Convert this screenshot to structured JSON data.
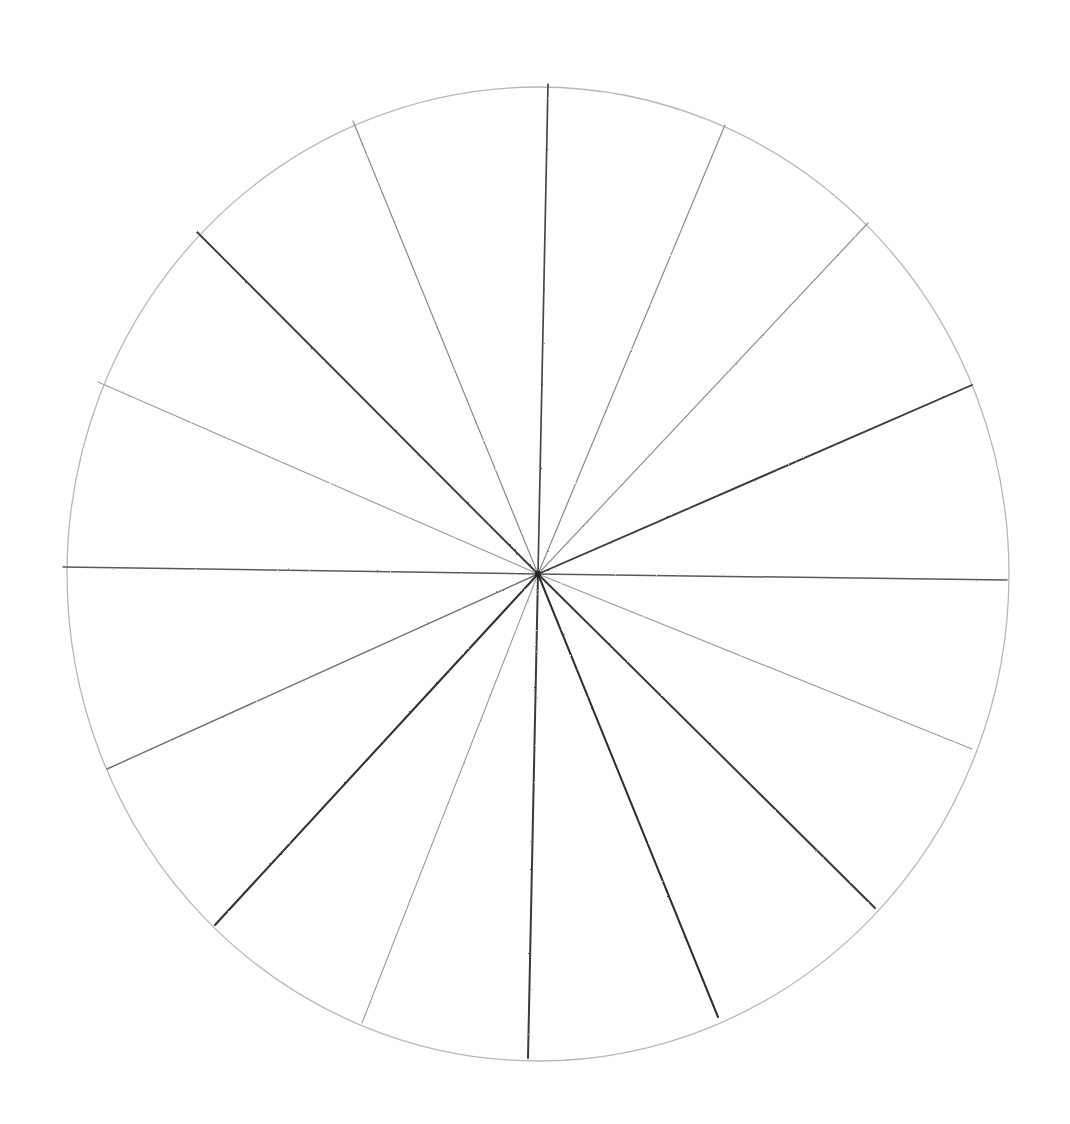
{
  "document": {
    "title": "Hand-drawn radial spoke circle",
    "medium": "pencil on white paper",
    "background_color": "#ffffff"
  },
  "chart_data": {
    "type": "pie",
    "title": "",
    "subtitle": "",
    "xlabel": "",
    "ylabel": "",
    "legend": [],
    "grid": false,
    "categories": [
      "S1",
      "S2",
      "S3",
      "S4",
      "S5",
      "S6",
      "S7",
      "S8",
      "S9",
      "S10",
      "S11",
      "S12",
      "S13",
      "S14",
      "S15",
      "S16"
    ],
    "values": [
      22.5,
      22.5,
      22.5,
      22.5,
      22.5,
      22.5,
      22.5,
      22.5,
      22.5,
      22.5,
      22.5,
      22.5,
      22.5,
      22.5,
      22.5,
      22.5
    ],
    "sector_count": 16,
    "sector_angle_degrees": 22.5,
    "circle": {
      "center_x": 538,
      "center_y": 574,
      "radius_x": 471,
      "radius_y": 487,
      "stroke_color": "#b8b8b8",
      "stroke_width": 1.3,
      "left_edge_x": 63,
      "right_edge_x": 1007,
      "top_edge_y": 84,
      "bottom_edge_y": 1058
    },
    "spokes": [
      {
        "id": "spoke-000",
        "angle_deg": 0.0,
        "end_x": 1007,
        "end_y": 580,
        "stroke": "#5a5a5a",
        "width": 1.5
      },
      {
        "id": "spoke-023",
        "angle_deg": 23.5,
        "end_x": 972,
        "end_y": 385,
        "stroke": "#3a3a3a",
        "width": 1.9
      },
      {
        "id": "spoke-047",
        "angle_deg": 46.8,
        "end_x": 868,
        "end_y": 223,
        "stroke": "#909090",
        "width": 1.2
      },
      {
        "id": "spoke-067",
        "angle_deg": 67.4,
        "end_x": 725,
        "end_y": 125,
        "stroke": "#8a8a8a",
        "width": 1.2
      },
      {
        "id": "spoke-089",
        "angle_deg": 88.8,
        "end_x": 548,
        "end_y": 84,
        "stroke": "#4a4a4a",
        "width": 1.7
      },
      {
        "id": "spoke-112",
        "angle_deg": 112.2,
        "end_x": 353,
        "end_y": 121,
        "stroke": "#8a8a8a",
        "width": 1.2
      },
      {
        "id": "spoke-135",
        "angle_deg": 135.1,
        "end_x": 197,
        "end_y": 232,
        "stroke": "#3d3d3d",
        "width": 1.9
      },
      {
        "id": "spoke-156",
        "angle_deg": 156.4,
        "end_x": 98,
        "end_y": 382,
        "stroke": "#9a9a9a",
        "width": 1.1
      },
      {
        "id": "spoke-180",
        "angle_deg": 180.0,
        "end_x": 63,
        "end_y": 567,
        "stroke": "#5a5a5a",
        "width": 1.5
      },
      {
        "id": "spoke-204",
        "angle_deg": 204.3,
        "end_x": 107,
        "end_y": 769,
        "stroke": "#707070",
        "width": 1.4
      },
      {
        "id": "spoke-227",
        "angle_deg": 227.2,
        "end_x": 215,
        "end_y": 925,
        "stroke": "#333333",
        "width": 2.1
      },
      {
        "id": "spoke-248",
        "angle_deg": 248.6,
        "end_x": 362,
        "end_y": 1023,
        "stroke": "#9a9a9a",
        "width": 1.1
      },
      {
        "id": "spoke-268",
        "angle_deg": 268.8,
        "end_x": 528,
        "end_y": 1058,
        "stroke": "#3a3a3a",
        "width": 2.0
      },
      {
        "id": "spoke-292",
        "angle_deg": 292.1,
        "end_x": 718,
        "end_y": 1017,
        "stroke": "#2e2e2e",
        "width": 2.0
      },
      {
        "id": "spoke-315",
        "angle_deg": 315.3,
        "end_x": 875,
        "end_y": 908,
        "stroke": "#3a3a3a",
        "width": 2.0
      },
      {
        "id": "spoke-338",
        "angle_deg": 338.0,
        "end_x": 972,
        "end_y": 749,
        "stroke": "#9a9a9a",
        "width": 1.1
      }
    ]
  }
}
